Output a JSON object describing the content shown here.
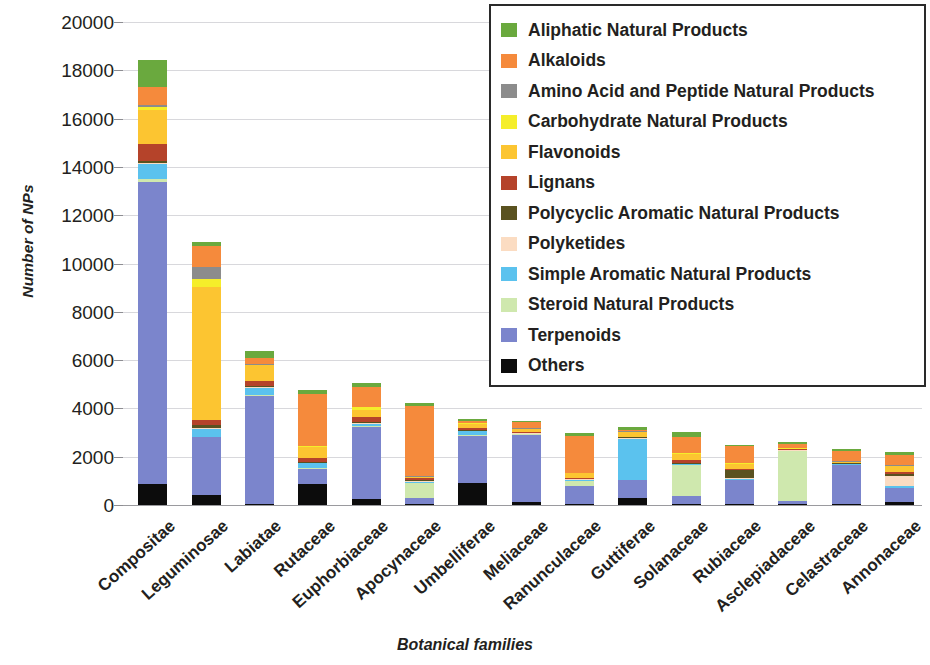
{
  "chart_data": {
    "type": "bar",
    "subtype": "stacked-bar",
    "title": "",
    "xlabel": "Botanical families",
    "ylabel": "Number of NPs",
    "ylim": [
      0,
      20000
    ],
    "ytick_step": 2000,
    "yticks": [
      20000,
      18000,
      16000,
      14000,
      12000,
      10000,
      8000,
      6000,
      4000,
      2000,
      0
    ],
    "ytick_labels": [
      "20000",
      "18000",
      "16000",
      "14000",
      "12000",
      "10000",
      "8000",
      "6000",
      "4000",
      "2000",
      "0"
    ],
    "grid": true,
    "legend_position": "top-right",
    "stack_order_bottom_to_top": [
      "Others",
      "Terpenoids",
      "Steroid Natural Products",
      "Simple Aromatic Natural Products",
      "Polyketides",
      "Polycyclic Aromatic Natural Products",
      "Lignans",
      "Flavonoids",
      "Carbohydrate Natural Products",
      "Amino Acid and Peptide Natural Products",
      "Alkaloids",
      "Aliphatic Natural Products"
    ],
    "categories": [
      "Compositae",
      "Leguminosae",
      "Labiatae",
      "Rutaceae",
      "Euphorbiaceae",
      "Apocynaceae",
      "Umbelliferae",
      "Meliaceae",
      "Ranunculaceae",
      "Guttiferae",
      "Solanaceae",
      "Rubiaceae",
      "Asclepiadaceae",
      "Celastraceae",
      "Annonaceae"
    ],
    "series": [
      {
        "name": "Others",
        "color": "#0c0c0c",
        "values": [
          870,
          400,
          60,
          850,
          250,
          40,
          900,
          110,
          40,
          300,
          40,
          60,
          30,
          40,
          110
        ]
      },
      {
        "name": "Terpenoids",
        "color": "#7b85cc",
        "values": [
          12500,
          2400,
          4450,
          650,
          3000,
          270,
          1950,
          2800,
          760,
          720,
          320,
          960,
          140,
          1610,
          580
        ]
      },
      {
        "name": "Steroid Natural Products",
        "color": "#cfe8ae",
        "values": [
          120,
          30,
          30,
          30,
          40,
          620,
          30,
          20,
          190,
          20,
          1290,
          30,
          2050,
          20,
          30
        ]
      },
      {
        "name": "Simple Aromatic Natural Products",
        "color": "#5bc2ee",
        "values": [
          620,
          330,
          300,
          200,
          60,
          30,
          170,
          20,
          60,
          1700,
          40,
          30,
          30,
          20,
          70
        ]
      },
      {
        "name": "Polyketides",
        "color": "#fbdcc2",
        "values": [
          60,
          40,
          30,
          30,
          30,
          30,
          20,
          20,
          30,
          30,
          30,
          30,
          20,
          20,
          430
        ]
      },
      {
        "name": "Polycyclic Aromatic Natural Products",
        "color": "#5a5220",
        "values": [
          70,
          120,
          40,
          40,
          60,
          30,
          30,
          20,
          20,
          30,
          30,
          350,
          20,
          20,
          60
        ]
      },
      {
        "name": "Lignans",
        "color": "#b5432a",
        "values": [
          690,
          190,
          230,
          160,
          190,
          100,
          100,
          20,
          30,
          30,
          100,
          40,
          20,
          20,
          90
        ]
      },
      {
        "name": "Flavonoids",
        "color": "#fcc531",
        "values": [
          1430,
          5530,
          640,
          440,
          320,
          30,
          170,
          130,
          180,
          180,
          260,
          220,
          30,
          30,
          230
        ]
      },
      {
        "name": "Carbohydrate Natural Products",
        "color": "#f5ee2a",
        "values": [
          110,
          320,
          30,
          30,
          100,
          20,
          20,
          20,
          20,
          20,
          30,
          20,
          20,
          20,
          30
        ]
      },
      {
        "name": "Amino Acid and Peptide Natural Products",
        "color": "#8c8c8c",
        "values": [
          90,
          480,
          30,
          20,
          30,
          20,
          20,
          20,
          20,
          20,
          20,
          20,
          20,
          20,
          20
        ]
      },
      {
        "name": "Alkaloids",
        "color": "#f58a3c",
        "values": [
          750,
          880,
          250,
          2140,
          830,
          2900,
          60,
          260,
          1500,
          80,
          680,
          690,
          170,
          430,
          410
        ]
      },
      {
        "name": "Aliphatic Natural Products",
        "color": "#6aa93e",
        "values": [
          1130,
          160,
          310,
          170,
          160,
          120,
          110,
          50,
          130,
          120,
          170,
          60,
          50,
          70,
          120
        ]
      }
    ],
    "totals": [
      18440,
      10880,
      6300,
      4760,
      5070,
      4210,
      3580,
      3490,
      2980,
      3250,
      3010,
      2510,
      2600,
      2320,
      2180
    ]
  },
  "legend": {
    "items": [
      {
        "label": "Aliphatic Natural Products",
        "color": "#6aa93e"
      },
      {
        "label": "Alkaloids",
        "color": "#f58a3c"
      },
      {
        "label": "Amino Acid and Peptide Natural Products",
        "color": "#8c8c8c"
      },
      {
        "label": "Carbohydrate Natural Products",
        "color": "#f5ee2a"
      },
      {
        "label": "Flavonoids",
        "color": "#fcc531"
      },
      {
        "label": "Lignans",
        "color": "#b5432a"
      },
      {
        "label": "Polycyclic Aromatic Natural Products",
        "color": "#5a5220"
      },
      {
        "label": "Polyketides",
        "color": "#fbdcc2"
      },
      {
        "label": "Simple Aromatic Natural Products",
        "color": "#5bc2ee"
      },
      {
        "label": "Steroid Natural Products",
        "color": "#cfe8ae"
      },
      {
        "label": "Terpenoids",
        "color": "#7b85cc"
      },
      {
        "label": "Others",
        "color": "#0c0c0c"
      }
    ]
  },
  "style": {
    "grid_color": "#d8d8dc",
    "axis_color": "#9a9a9e",
    "text_color": "#231f20",
    "background": "#ffffff"
  }
}
